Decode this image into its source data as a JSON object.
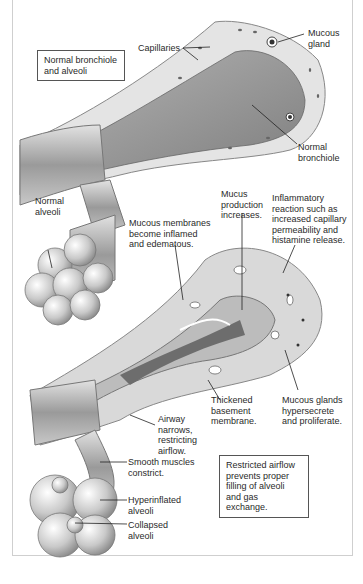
{
  "diagram": {
    "title_boxes": {
      "normal": "Normal bronchiole and alveoli",
      "restricted": "Restricted airflow prevents proper filling of alveoli and gas exchange."
    },
    "normal_labels": {
      "capillaries": "Capillaries",
      "mucous_gland": [
        "Mucous",
        "gland"
      ],
      "normal_bronchiole": [
        "Normal",
        "bronchiole"
      ],
      "normal_alveoli": [
        "Normal",
        "alveoli"
      ]
    },
    "asthma_labels": {
      "mucous_membranes": [
        "Mucous membranes",
        "become inflamed",
        "and edematous."
      ],
      "mucus_production": [
        "Mucus",
        "production",
        "increases."
      ],
      "inflammatory": [
        "Inflammatory",
        "reaction such as",
        "increased capillary",
        "permeability and",
        "histamine release."
      ],
      "thickened_membrane": [
        "Thickened",
        "basement",
        "membrane."
      ],
      "mucous_glands": [
        "Mucous glands",
        "hypersecrete",
        "and proliferate."
      ],
      "airway_narrows": [
        "Airway",
        "narrows,",
        "restricting",
        "airflow."
      ],
      "smooth_muscles": [
        "Smooth muscles",
        "constrict."
      ],
      "hyperinflated": [
        "Hyperinflated",
        "alveoli"
      ],
      "collapsed": [
        "Collapsed",
        "alveoli"
      ]
    }
  }
}
